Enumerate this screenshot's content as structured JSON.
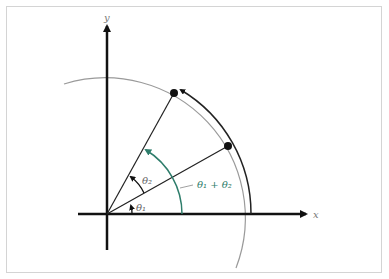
{
  "diagram": {
    "axes": {
      "x_label": "x",
      "y_label": "y"
    },
    "angles": {
      "theta1": "θ₁",
      "theta2": "θ₂",
      "sum": "θ₁ + θ₂"
    },
    "colors": {
      "axis": "#111111",
      "circle": "#9a9a9a",
      "sum_arc": "#2e7d6b",
      "label_gray": "#777777"
    },
    "points": [
      {
        "name": "rotated-by-theta1",
        "x": 228,
        "y": 146
      },
      {
        "name": "rotated-by-theta1-plus-theta2",
        "x": 174,
        "y": 93
      }
    ]
  }
}
